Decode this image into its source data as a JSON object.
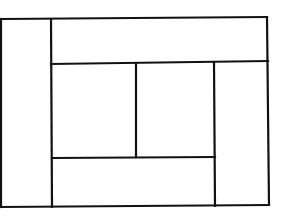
{
  "diagram": {
    "type": "rectangular-partition",
    "width": 281,
    "height": 216,
    "stroke_color": "#111111",
    "background": "#ffffff",
    "lines": [
      {
        "name": "outer-top",
        "x1": 1,
        "y1": 19,
        "x2": 267,
        "y2": 17
      },
      {
        "name": "outer-bottom",
        "x1": 1,
        "y1": 207,
        "x2": 269,
        "y2": 205
      },
      {
        "name": "outer-left",
        "x1": 1,
        "y1": 19,
        "x2": 1,
        "y2": 207
      },
      {
        "name": "outer-right",
        "x1": 267,
        "y1": 17,
        "x2": 269,
        "y2": 205
      },
      {
        "name": "left-column-divider",
        "x1": 51,
        "y1": 19,
        "x2": 52,
        "y2": 207
      },
      {
        "name": "upper-horizontal",
        "x1": 51,
        "y1": 64,
        "x2": 268,
        "y2": 61
      },
      {
        "name": "middle-vertical",
        "x1": 136,
        "y1": 64,
        "x2": 136,
        "y2": 157
      },
      {
        "name": "right-column-divider",
        "x1": 214,
        "y1": 62,
        "x2": 215,
        "y2": 206
      },
      {
        "name": "lower-horizontal",
        "x1": 52,
        "y1": 158,
        "x2": 215,
        "y2": 157
      }
    ],
    "regions": [
      {
        "name": "left-column"
      },
      {
        "name": "top-banner"
      },
      {
        "name": "center-left-cell"
      },
      {
        "name": "center-right-cell"
      },
      {
        "name": "right-column"
      },
      {
        "name": "bottom-banner"
      }
    ]
  }
}
